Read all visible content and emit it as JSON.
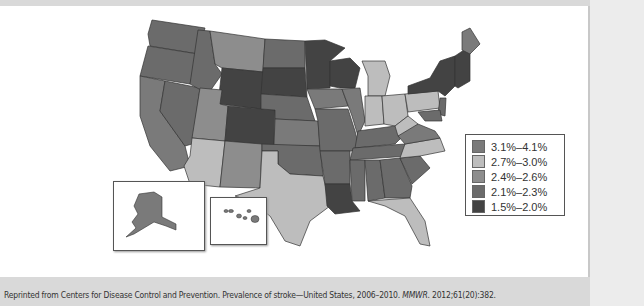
{
  "map": {
    "title": "Prevalence of stroke by state",
    "colors": {
      "c1": "#7a7a7a",
      "c2": "#bdbdbd",
      "c3": "#8d8d8d",
      "c4": "#6b6b6b",
      "c5": "#434343"
    },
    "legend": [
      {
        "label": "3.1%–4.1%",
        "color": "#7a7a7a"
      },
      {
        "label": "2.7%–3.0%",
        "color": "#bdbdbd"
      },
      {
        "label": "2.4%–2.6%",
        "color": "#8d8d8d"
      },
      {
        "label": "2.1%–2.3%",
        "color": "#6b6b6b"
      },
      {
        "label": "1.5%–2.0%",
        "color": "#434343"
      }
    ],
    "insets": [
      "Alaska",
      "Hawaii"
    ]
  },
  "caption": {
    "prefix": "Reprinted from Centers for Disease Control and Prevention. Prevalence of stroke—United States, 2006–2010. ",
    "journal": "MMWR",
    "suffix": ". 2012;61(20):382."
  }
}
